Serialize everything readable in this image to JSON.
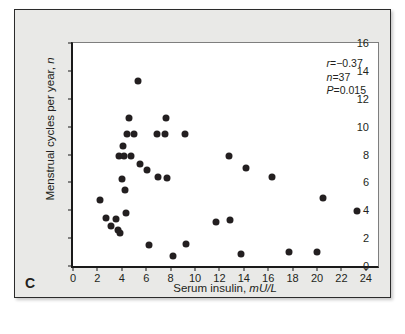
{
  "figure": {
    "panel_label": "C",
    "background_color": "#e9e9e7",
    "plot_background_color": "#ffffff",
    "marker_color": "#231f20"
  },
  "chart_data": {
    "type": "scatter",
    "title": "",
    "xlabel": "Serum insulin, mU/L",
    "xlabel_main": "Serum insulin,",
    "xlabel_units": "mU/L",
    "ylabel": "Menstrual cycles per year, n",
    "ylabel_main": "Menstrual cycles per year,",
    "ylabel_units": "n",
    "xlim": [
      0,
      25
    ],
    "ylim": [
      0,
      16
    ],
    "xticks": [
      0,
      2,
      4,
      6,
      8,
      10,
      12,
      14,
      16,
      18,
      20,
      22,
      24
    ],
    "yticks": [
      0,
      2,
      4,
      6,
      8,
      10,
      12,
      14,
      16
    ],
    "grid": false,
    "legend": null,
    "annotations": {
      "r_label": "r",
      "r_value": "=−0.37",
      "n_label": "n",
      "n_value": "=37",
      "p_label": "P",
      "p_value": "=0.015"
    },
    "stats": {
      "r": -0.37,
      "n": 37,
      "p": 0.015
    },
    "points": [
      {
        "x": 2.2,
        "y": 4.7
      },
      {
        "x": 2.7,
        "y": 3.45
      },
      {
        "x": 3.1,
        "y": 2.9
      },
      {
        "x": 3.5,
        "y": 3.35
      },
      {
        "x": 3.7,
        "y": 2.6
      },
      {
        "x": 3.8,
        "y": 7.9
      },
      {
        "x": 3.85,
        "y": 2.35
      },
      {
        "x": 4.05,
        "y": 6.25
      },
      {
        "x": 4.1,
        "y": 8.6
      },
      {
        "x": 4.2,
        "y": 7.9
      },
      {
        "x": 4.3,
        "y": 5.45
      },
      {
        "x": 4.35,
        "y": 3.8
      },
      {
        "x": 4.45,
        "y": 9.5
      },
      {
        "x": 4.6,
        "y": 10.6
      },
      {
        "x": 4.75,
        "y": 7.9
      },
      {
        "x": 5.0,
        "y": 9.5
      },
      {
        "x": 5.3,
        "y": 13.3
      },
      {
        "x": 5.5,
        "y": 7.35
      },
      {
        "x": 6.1,
        "y": 6.9
      },
      {
        "x": 6.2,
        "y": 1.5
      },
      {
        "x": 6.9,
        "y": 9.5
      },
      {
        "x": 7.0,
        "y": 6.4
      },
      {
        "x": 7.5,
        "y": 9.5
      },
      {
        "x": 7.6,
        "y": 10.6
      },
      {
        "x": 7.7,
        "y": 6.3
      },
      {
        "x": 8.2,
        "y": 0.7
      },
      {
        "x": 9.15,
        "y": 9.5
      },
      {
        "x": 9.3,
        "y": 1.55
      },
      {
        "x": 11.7,
        "y": 3.15
      },
      {
        "x": 12.8,
        "y": 7.9
      },
      {
        "x": 12.9,
        "y": 3.3
      },
      {
        "x": 13.8,
        "y": 0.85
      },
      {
        "x": 14.2,
        "y": 7.05
      },
      {
        "x": 16.3,
        "y": 6.4
      },
      {
        "x": 17.7,
        "y": 1.0
      },
      {
        "x": 20.0,
        "y": 1.0
      },
      {
        "x": 20.5,
        "y": 4.9
      },
      {
        "x": 23.3,
        "y": 3.95
      }
    ]
  }
}
